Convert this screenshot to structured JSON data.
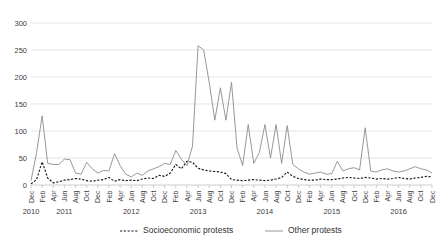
{
  "chart_data": {
    "type": "line",
    "title": "",
    "xlabel": "",
    "ylabel": "",
    "ylim": [
      0,
      300
    ],
    "yticks": [
      0,
      50,
      100,
      150,
      200,
      250,
      300
    ],
    "grid": true,
    "legend_position": "bottom",
    "x": [
      "Dec 2010",
      "Jan 2011",
      "Feb 2011",
      "Mar 2011",
      "Apr 2011",
      "May 2011",
      "Jun 2011",
      "Jul 2011",
      "Aug 2011",
      "Sep 2011",
      "Oct 2011",
      "Nov 2011",
      "Dec 2011",
      "Jan 2012",
      "Feb 2012",
      "Mar 2012",
      "Apr 2012",
      "May 2012",
      "Jun 2012",
      "Jul 2012",
      "Aug 2012",
      "Sep 2012",
      "Oct 2012",
      "Nov 2012",
      "Dec 2012",
      "Jan 2013",
      "Feb 2013",
      "Mar 2013",
      "Apr 2013",
      "May 2013",
      "Jun 2013",
      "Jul 2013",
      "Aug 2013",
      "Sep 2013",
      "Oct 2013",
      "Nov 2013",
      "Dec 2013",
      "Jan 2014",
      "Feb 2014",
      "Mar 2014",
      "Apr 2014",
      "May 2014",
      "Jun 2014",
      "Jul 2014",
      "Aug 2014",
      "Sep 2014",
      "Oct 2014",
      "Nov 2014",
      "Dec 2014",
      "Jan 2015",
      "Feb 2015",
      "Mar 2015",
      "Apr 2015",
      "May 2015",
      "Jun 2015",
      "Jul 2015",
      "Aug 2015",
      "Sep 2015",
      "Oct 2015",
      "Nov 2015",
      "Dec 2015",
      "Jan 2016",
      "Feb 2016",
      "Mar 2016",
      "Apr 2016",
      "May 2016",
      "Jun 2016",
      "Jul 2016",
      "Aug 2016",
      "Sep 2016",
      "Oct 2016",
      "Nov 2016",
      "Dec 2016"
    ],
    "xtick_labels": [
      "Dec",
      "",
      "Feb",
      "",
      "Apr",
      "",
      "Jun",
      "",
      "Aug",
      "",
      "Oct",
      "",
      "Dec",
      "",
      "Feb",
      "",
      "Apr",
      "",
      "Jun",
      "",
      "Aug",
      "",
      "Oct",
      "",
      "Dec",
      "",
      "Feb",
      "",
      "Apr",
      "",
      "Jun",
      "",
      "Aug",
      "",
      "Oct",
      "",
      "Dec",
      "",
      "Feb",
      "",
      "Apr",
      "",
      "Jun",
      "",
      "Aug",
      "",
      "Oct",
      "",
      "Dec",
      "",
      "Feb",
      "",
      "Apr",
      "",
      "Jun",
      "",
      "Aug",
      "",
      "Oct",
      "",
      "Dec",
      "",
      "Feb",
      "",
      "Apr",
      "",
      "Jun",
      "",
      "Aug",
      "",
      "Oct",
      "",
      "Dec"
    ],
    "year_groups": [
      {
        "label": "2010",
        "index": 0
      },
      {
        "label": "2011",
        "index": 6
      },
      {
        "label": "2012",
        "index": 18
      },
      {
        "label": "2013",
        "index": 30
      },
      {
        "label": "2014",
        "index": 42
      },
      {
        "label": "2015",
        "index": 54
      },
      {
        "label": "2016",
        "index": 66
      }
    ],
    "series": [
      {
        "name": "Socioeconomic protests",
        "style": "dashed",
        "color": "#1a1a1a",
        "values": [
          2,
          10,
          43,
          13,
          4,
          6,
          9,
          10,
          12,
          11,
          8,
          7,
          9,
          10,
          14,
          7,
          10,
          8,
          9,
          8,
          11,
          13,
          12,
          18,
          16,
          22,
          38,
          30,
          44,
          42,
          31,
          28,
          26,
          25,
          24,
          21,
          10,
          9,
          8,
          9,
          10,
          9,
          8,
          9,
          11,
          14,
          24,
          16,
          12,
          10,
          9,
          9,
          11,
          10,
          10,
          11,
          13,
          14,
          13,
          12,
          14,
          13,
          11,
          12,
          11,
          12,
          14,
          12,
          11,
          13,
          14,
          16,
          15
        ]
      },
      {
        "name": "Other protests",
        "style": "solid",
        "color": "#8c8c8c",
        "values": [
          8,
          60,
          128,
          40,
          38,
          38,
          48,
          47,
          22,
          20,
          42,
          30,
          22,
          27,
          26,
          58,
          36,
          20,
          15,
          22,
          18,
          26,
          30,
          34,
          40,
          38,
          64,
          48,
          36,
          72,
          258,
          250,
          190,
          120,
          180,
          120,
          190,
          68,
          36,
          112,
          40,
          60,
          112,
          50,
          112,
          40,
          110,
          38,
          30,
          24,
          20,
          22,
          24,
          20,
          21,
          44,
          26,
          30,
          32,
          28,
          106,
          26,
          24,
          28,
          30,
          26,
          24,
          26,
          30,
          34,
          30,
          28,
          22
        ]
      }
    ]
  },
  "legend": {
    "items": [
      {
        "label": "Socioeconomic protests",
        "style": "dashed"
      },
      {
        "label": "Other protests",
        "style": "solid"
      }
    ]
  }
}
